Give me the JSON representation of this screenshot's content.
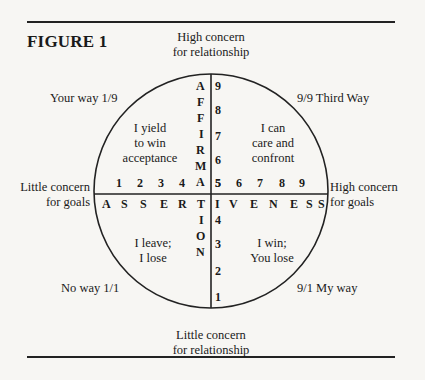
{
  "figure": {
    "title": "FIGURE 1",
    "axes": {
      "top_label_1": "High concern",
      "top_label_2": "for relationship",
      "bottom_label_1": "Little concern",
      "bottom_label_2": "for relationship",
      "left_label_1": "Little concern",
      "left_label_2": "for goals",
      "right_label_1": "High concern",
      "right_label_2": "for goals"
    },
    "corners": {
      "top_left": "Your way 1/9",
      "top_right": "9/9 Third Way",
      "bottom_left": "No way 1/1",
      "bottom_right": "9/1 My way"
    },
    "quadrants": {
      "top_left": [
        "I yield",
        "to win",
        "acceptance"
      ],
      "top_right": [
        "I can",
        "care and",
        "confront"
      ],
      "bottom_left": [
        "I leave;",
        "I lose"
      ],
      "bottom_right": [
        "I win;",
        "You lose"
      ]
    },
    "vertical_word": [
      "A",
      "F",
      "F",
      "I",
      "R",
      "M",
      "A",
      "T",
      "I",
      "O",
      "N"
    ],
    "horizontal_word": [
      "A",
      "S",
      "S",
      "E",
      "R",
      "T",
      "I",
      "V",
      "E",
      "N",
      "E",
      "S",
      "S"
    ],
    "vertical_scale": [
      "9",
      "8",
      "7",
      "6",
      "5",
      "4",
      "3",
      "2",
      "1"
    ],
    "horizontal_scale": [
      "1",
      "2",
      "3",
      "4",
      "5",
      "6",
      "7",
      "8",
      "9"
    ]
  }
}
